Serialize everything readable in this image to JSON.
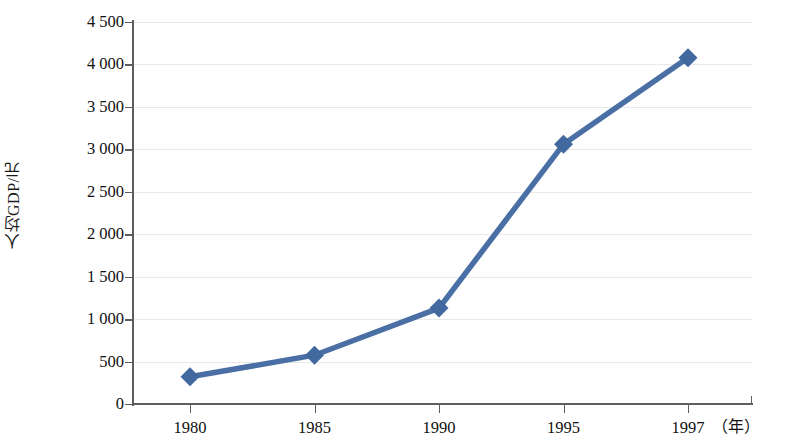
{
  "chart_data": {
    "type": "line",
    "title": "",
    "subtitle": "",
    "xlabel": "（年）",
    "ylabel": "人均GDP/元",
    "categories": [
      "1980",
      "1985",
      "1990",
      "1995",
      "1997"
    ],
    "x": [
      1980,
      1985,
      1990,
      1995,
      1997
    ],
    "values": [
      320,
      575,
      1130,
      3060,
      4080
    ],
    "series": [
      {
        "name": "人均GDP/元",
        "values": [
          320,
          575,
          1130,
          3060,
          4080
        ]
      }
    ],
    "ylim": [
      0,
      4500
    ],
    "y_ticks": [
      0,
      500,
      1000,
      1500,
      2000,
      2500,
      3000,
      3500,
      4000,
      4500
    ],
    "y_tick_labels": [
      "0",
      "500",
      "1 000",
      "1 500",
      "2 000",
      "2 500",
      "3 000",
      "3 500",
      "4 000",
      "4 500"
    ],
    "x_tick_labels": [
      "1980",
      "1985",
      "1990",
      "1995",
      "1997"
    ],
    "grid": true,
    "grid_axis": "y",
    "legend": false,
    "legend_position": "none",
    "marker": "diamond",
    "annotations": []
  },
  "style": {
    "series_color": "#4a6fa5",
    "marker_color": "#41689f",
    "axis_color": "#5d5d5d",
    "grid_color": "#e9e9e9",
    "text_color": "#111111",
    "background": "#ffffff"
  }
}
